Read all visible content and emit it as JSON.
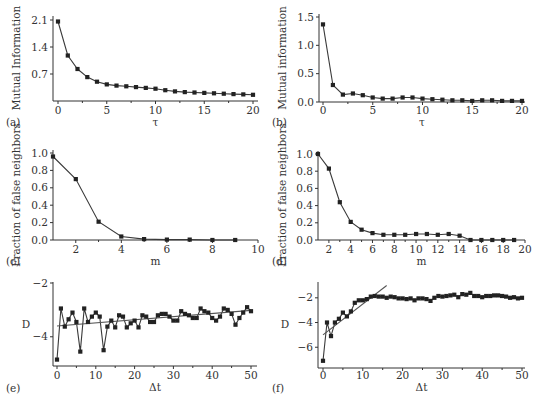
{
  "chart_data": [
    {
      "id": "a",
      "type": "line",
      "panel_label": "(a)",
      "xlabel": "τ",
      "ylabel": "Mutual Information",
      "xlim": [
        0,
        20
      ],
      "ylim": [
        0,
        2.1
      ],
      "xticks": [
        0,
        5,
        10,
        15,
        20
      ],
      "xtick_labels": [
        "0",
        "5",
        "10",
        "15",
        "20"
      ],
      "yticks": [
        0.7,
        1.4,
        2.1
      ],
      "ytick_labels": [
        "0.7",
        "1.4",
        "2.1"
      ],
      "x": [
        0,
        1,
        2,
        3,
        4,
        5,
        6,
        7,
        8,
        9,
        10,
        11,
        12,
        13,
        14,
        15,
        16,
        17,
        18,
        19,
        20
      ],
      "y": [
        2.06,
        1.18,
        0.83,
        0.62,
        0.5,
        0.43,
        0.4,
        0.38,
        0.36,
        0.34,
        0.32,
        0.28,
        0.25,
        0.23,
        0.22,
        0.21,
        0.2,
        0.19,
        0.18,
        0.17,
        0.16
      ]
    },
    {
      "id": "b",
      "type": "line",
      "panel_label": "(b)",
      "xlabel": "τ",
      "ylabel": "Mutual information",
      "xlim": [
        0,
        20
      ],
      "ylim": [
        0,
        1.5
      ],
      "xticks": [
        0,
        5,
        10,
        15,
        20
      ],
      "xtick_labels": [
        "0",
        "5",
        "10",
        "15",
        "20"
      ],
      "yticks": [
        0.0,
        0.5,
        1.0,
        1.5
      ],
      "ytick_labels": [
        "0.0",
        "0.5",
        "1.0",
        "1.5"
      ],
      "x": [
        0,
        1,
        2,
        3,
        4,
        5,
        6,
        7,
        8,
        9,
        10,
        11,
        12,
        13,
        14,
        15,
        16,
        17,
        18,
        19,
        20
      ],
      "y": [
        1.37,
        0.3,
        0.13,
        0.15,
        0.12,
        0.08,
        0.06,
        0.06,
        0.08,
        0.08,
        0.06,
        0.05,
        0.04,
        0.03,
        0.03,
        0.02,
        0.03,
        0.03,
        0.02,
        0.02,
        0.02
      ]
    },
    {
      "id": "c",
      "type": "line",
      "panel_label": "(c)",
      "xlabel": "m",
      "ylabel": "Fraction of false neighbors",
      "xlim": [
        1,
        10
      ],
      "ylim": [
        0,
        1.0
      ],
      "xticks": [
        2,
        4,
        6,
        8,
        10
      ],
      "xtick_labels": [
        "2",
        "4",
        "6",
        "8",
        "10"
      ],
      "yticks": [
        0.0,
        0.2,
        0.4,
        0.6,
        0.8,
        1.0
      ],
      "ytick_labels": [
        "0.0",
        "0.2",
        "0.4",
        "0.6",
        "0.8",
        "1.0"
      ],
      "x": [
        1,
        2,
        3,
        4,
        5,
        6,
        7,
        8,
        9
      ],
      "y": [
        0.96,
        0.7,
        0.21,
        0.04,
        0.01,
        0.005,
        0.005,
        0.0,
        0.0
      ]
    },
    {
      "id": "d",
      "type": "line",
      "panel_label": "(d)",
      "xlabel": "m",
      "ylabel": "Fraction of false neighbors",
      "xlim": [
        1,
        20
      ],
      "ylim": [
        0,
        1.0
      ],
      "xticks": [
        2,
        4,
        6,
        8,
        10,
        12,
        14,
        16,
        18,
        20
      ],
      "xtick_labels": [
        "2",
        "4",
        "6",
        "8",
        "10",
        "12",
        "14",
        "16",
        "18",
        "20"
      ],
      "yticks": [
        0.0,
        0.2,
        0.4,
        0.6,
        0.8,
        1.0
      ],
      "ytick_labels": [
        "0.0",
        "0.2",
        "0.4",
        "0.6",
        "0.8",
        "1.0"
      ],
      "x": [
        1,
        2,
        3,
        4,
        5,
        6,
        7,
        8,
        9,
        10,
        11,
        12,
        13,
        14,
        15,
        16,
        17,
        18,
        19
      ],
      "y": [
        1.0,
        0.83,
        0.44,
        0.21,
        0.12,
        0.08,
        0.06,
        0.06,
        0.06,
        0.07,
        0.07,
        0.06,
        0.07,
        0.05,
        0.0,
        0.0,
        0.0,
        0.0,
        0.0
      ]
    },
    {
      "id": "e",
      "type": "line",
      "panel_label": "(e)",
      "xlabel": "Δt",
      "ylabel": "D",
      "xlim": [
        0,
        50
      ],
      "ylim": [
        -5.05,
        -2
      ],
      "xticks": [
        0,
        10,
        20,
        30,
        40,
        50
      ],
      "xtick_labels": [
        "0",
        "10",
        "20",
        "30",
        "40",
        "50"
      ],
      "yticks": [
        -2,
        -4
      ],
      "ytick_labels": [
        "−2",
        "−4"
      ],
      "x": [
        0,
        1,
        2,
        3,
        4,
        5,
        6,
        7,
        8,
        9,
        10,
        11,
        12,
        13,
        14,
        15,
        16,
        17,
        18,
        19,
        20,
        21,
        22,
        23,
        24,
        25,
        26,
        27,
        28,
        29,
        30,
        31,
        32,
        33,
        34,
        35,
        36,
        37,
        38,
        39,
        40,
        41,
        42,
        43,
        44,
        45,
        46,
        47,
        48,
        49,
        50
      ],
      "y": [
        -4.85,
        -2.95,
        -3.62,
        -3.35,
        -3.1,
        -3.45,
        -4.55,
        -2.95,
        -3.45,
        -3.25,
        -3.1,
        -3.25,
        -4.5,
        -3.62,
        -3.4,
        -3.65,
        -3.2,
        -3.25,
        -3.65,
        -3.5,
        -3.4,
        -3.65,
        -3.2,
        -3.25,
        -3.45,
        -3.45,
        -3.2,
        -3.15,
        -3.15,
        -3.25,
        -3.4,
        -3.4,
        -3.05,
        -3.15,
        -3.2,
        -3.3,
        -3.3,
        -2.95,
        -3.05,
        -3.1,
        -3.3,
        -3.4,
        -3.25,
        -2.95,
        -3.0,
        -3.15,
        -3.55,
        -3.3,
        -3.1,
        -2.9,
        -3.05
      ],
      "fit_line": {
        "x": [
          0,
          50
        ],
        "y": [
          -3.6,
          -3.02
        ]
      }
    },
    {
      "id": "f",
      "type": "line",
      "panel_label": "(f)",
      "xlabel": "Δt",
      "ylabel": "D",
      "xlim": [
        0,
        50
      ],
      "ylim": [
        -7.6,
        -0.8
      ],
      "xticks": [
        0,
        10,
        20,
        30,
        40,
        50
      ],
      "xtick_labels": [
        "0",
        "10",
        "20",
        "30",
        "40",
        "50"
      ],
      "yticks": [
        -2,
        -4,
        -6
      ],
      "ytick_labels": [
        "−2",
        "−4",
        "−6"
      ],
      "x": [
        0,
        1,
        2,
        3,
        4,
        5,
        6,
        7,
        8,
        9,
        10,
        11,
        12,
        13,
        14,
        15,
        16,
        17,
        18,
        19,
        20,
        21,
        22,
        23,
        24,
        25,
        26,
        27,
        28,
        29,
        30,
        31,
        32,
        33,
        34,
        35,
        36,
        37,
        38,
        39,
        40,
        41,
        42,
        43,
        44,
        45,
        46,
        47,
        48,
        49,
        50
      ],
      "y": [
        -7.1,
        -4.0,
        -5.1,
        -4.0,
        -3.7,
        -3.2,
        -3.5,
        -3.1,
        -2.4,
        -2.2,
        -2.2,
        -2.1,
        -1.9,
        -1.85,
        -1.9,
        -1.9,
        -2.0,
        -1.9,
        -1.95,
        -2.05,
        -2.05,
        -2.1,
        -2.05,
        -2.2,
        -2.05,
        -2.05,
        -2.1,
        -2.25,
        -2.0,
        -1.85,
        -1.9,
        -1.85,
        -1.8,
        -1.75,
        -1.95,
        -1.7,
        -1.75,
        -1.6,
        -1.85,
        -1.85,
        -1.95,
        -1.85,
        -1.85,
        -1.8,
        -1.8,
        -1.85,
        -1.9,
        -2.0,
        -1.95,
        -2.05,
        -2.0
      ],
      "fit_line": {
        "x": [
          0,
          16
        ],
        "y": [
          -5.0,
          -1.0
        ]
      }
    }
  ]
}
